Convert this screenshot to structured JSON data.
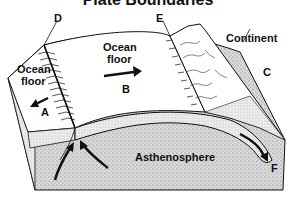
{
  "title": "Plate Boundaries",
  "labels": {
    "A": "A",
    "B": "B",
    "C": "C",
    "D": "D",
    "E": "E",
    "F": "F",
    "continent": "Continent",
    "ocean_floor_left_1": "Ocean",
    "ocean_floor_left_2": "floor",
    "ocean_floor_center_1": "Ocean",
    "ocean_floor_center_2": "floor",
    "asthenosphere": "Asthenosphere"
  },
  "colors": {
    "line": "#111111",
    "stipple": "#c8c8c8",
    "surface": "#ffffff"
  }
}
